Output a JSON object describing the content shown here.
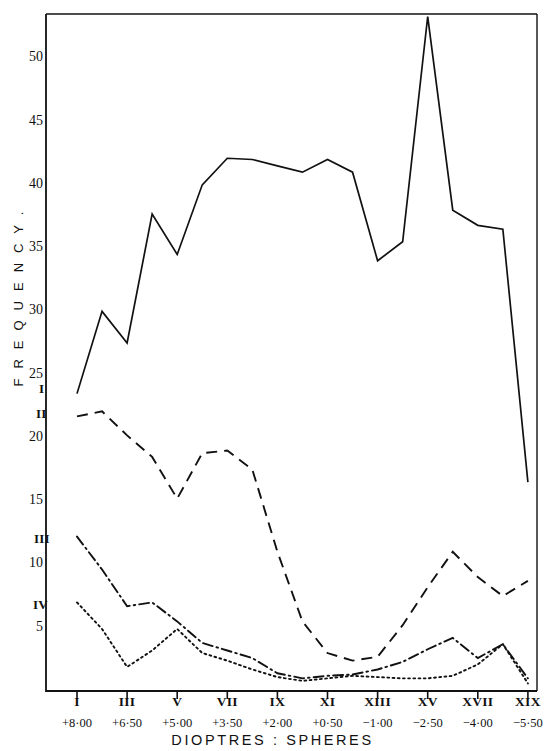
{
  "chart_data": {
    "type": "line",
    "title": "",
    "xlabel": "DIOPTRES : SPHERES",
    "ylabel": "F R E Q U E N C Y .",
    "ylim": [
      0,
      53.5
    ],
    "yticks": [
      5,
      10,
      15,
      20,
      25,
      30,
      35,
      40,
      45,
      50
    ],
    "grid": false,
    "legend_position": "inline-left",
    "categories": [
      "I",
      "II",
      "III",
      "IV",
      "V",
      "VI",
      "VII",
      "VIII",
      "IX",
      "X",
      "XI",
      "XII",
      "XIII",
      "XIV",
      "XV",
      "XVI",
      "XVII",
      "XVIII",
      "XIX"
    ],
    "xtick_labels": [
      "I",
      "III",
      "V",
      "VII",
      "IX",
      "XI",
      "XIII",
      "XV",
      "XVII",
      "XIX"
    ],
    "xtick_categories": [
      "I",
      "III",
      "V",
      "VII",
      "IX",
      "XI",
      "XIII",
      "XV",
      "XVII",
      "XIX"
    ],
    "dioptres_labels": [
      "+8·00",
      "+6·50",
      "+5·00",
      "+3·50",
      "+2·00",
      "+0·50",
      "−1·00",
      "−2·50",
      "−4·00",
      "−5·50"
    ],
    "series": [
      {
        "name": "I",
        "style": "solid",
        "label": "I",
        "values": [
          23.5,
          30.0,
          27.5,
          37.7,
          34.5,
          40.0,
          42.1,
          42.0,
          41.5,
          41.0,
          42.0,
          41.0,
          34.0,
          35.5,
          53.3,
          38.0,
          36.8,
          36.5,
          16.5
        ]
      },
      {
        "name": "II",
        "style": "dashed",
        "label": "II",
        "values": [
          21.7,
          22.1,
          20.2,
          18.5,
          15.2,
          18.8,
          19.0,
          17.5,
          11.0,
          5.5,
          3.0,
          2.4,
          2.7,
          5.2,
          8.2,
          11.0,
          9.0,
          7.5,
          8.7
        ]
      },
      {
        "name": "III",
        "style": "dashdot",
        "label": "III",
        "values": [
          12.2,
          9.6,
          6.7,
          7.0,
          5.5,
          3.8,
          3.2,
          2.6,
          1.4,
          1.0,
          1.2,
          1.3,
          1.7,
          2.3,
          3.3,
          4.2,
          2.6,
          3.7,
          1.0
        ]
      },
      {
        "name": "IV",
        "style": "dotted",
        "label": "IV",
        "values": [
          7.0,
          4.9,
          1.9,
          3.2,
          4.9,
          3.0,
          2.4,
          1.7,
          1.1,
          0.8,
          1.0,
          1.2,
          1.1,
          1.0,
          1.0,
          1.2,
          2.1,
          3.7,
          0.6
        ]
      }
    ]
  },
  "axis": {
    "frame_color": "#111111",
    "series_colors": [
      "#111111",
      "#111111",
      "#111111",
      "#111111"
    ]
  }
}
